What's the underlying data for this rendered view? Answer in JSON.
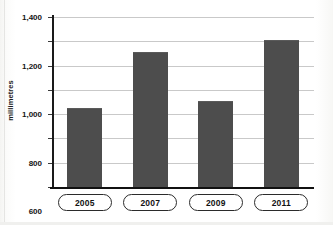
{
  "chart_data": {
    "type": "bar",
    "title": "",
    "xlabel": "",
    "ylabel": "millimetres",
    "categories": [
      "2005",
      "2007",
      "2009",
      "2011"
    ],
    "values": [
      640,
      1100,
      700,
      1200
    ],
    "ylim": [
      0,
      1400
    ],
    "ytick_values": [
      0,
      200,
      400,
      600,
      800,
      1000,
      1200,
      1400
    ],
    "ytick_labels": [
      "0",
      "200",
      "400",
      "600",
      "800",
      "1,000",
      "1,200",
      "1,400"
    ],
    "grid": true,
    "legend": false,
    "bar_color": "#4d4d4d",
    "gridline_color": "#c9c9c9",
    "axis_color": "#111111"
  }
}
